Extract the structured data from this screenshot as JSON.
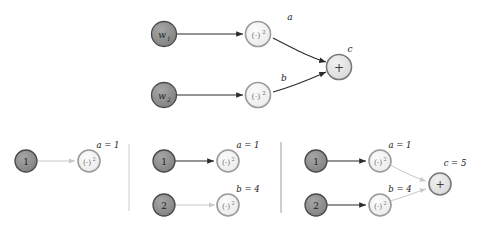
{
  "figure": {
    "title": ""
  },
  "colors": {
    "input_node_fill": "#8c8c8c",
    "input_node_stroke": "#4a4a4a",
    "op_node_fill": "#f2f2f2",
    "op_node_stroke": "#9a9a9a",
    "sum_node_fill": "#e0e0e0",
    "sum_node_stroke": "#7a7a7a",
    "edge_active": "#2b2b2b",
    "edge_inactive": "#c9c9c9",
    "divider": "#b8b8b8",
    "text": "#1a1a1a"
  },
  "top_graph": {
    "nodes": {
      "w1": {
        "label": "w",
        "subscript": "1"
      },
      "w2": {
        "label": "w",
        "subscript": "2"
      },
      "sq1": {
        "label": "(·)",
        "superscript": "2"
      },
      "sq2": {
        "label": "(·)",
        "superscript": "2"
      },
      "sum": {
        "label": "+"
      }
    },
    "edge_labels": {
      "a": "a",
      "b": "b",
      "c": "c"
    }
  },
  "panels": [
    {
      "name": "panel-1",
      "nodes": {
        "in1": {
          "label": "1"
        },
        "sq1": {
          "label": "(·)",
          "superscript": "2"
        }
      },
      "edge_labels": {
        "a": "a = 1"
      }
    },
    {
      "name": "panel-2",
      "nodes": {
        "in1": {
          "label": "1"
        },
        "in2": {
          "label": "2"
        },
        "sq1": {
          "label": "(·)",
          "superscript": "2"
        },
        "sq2": {
          "label": "(·)",
          "superscript": "2"
        }
      },
      "edge_labels": {
        "a": "a = 1",
        "b": "b = 4"
      }
    },
    {
      "name": "panel-3",
      "nodes": {
        "in1": {
          "label": "1"
        },
        "in2": {
          "label": "2"
        },
        "sq1": {
          "label": "(·)",
          "superscript": "2"
        },
        "sq2": {
          "label": "(·)",
          "superscript": "2"
        },
        "sum": {
          "label": "+"
        }
      },
      "edge_labels": {
        "a": "a = 1",
        "b": "b = 4",
        "c": "c = 5"
      }
    }
  ]
}
